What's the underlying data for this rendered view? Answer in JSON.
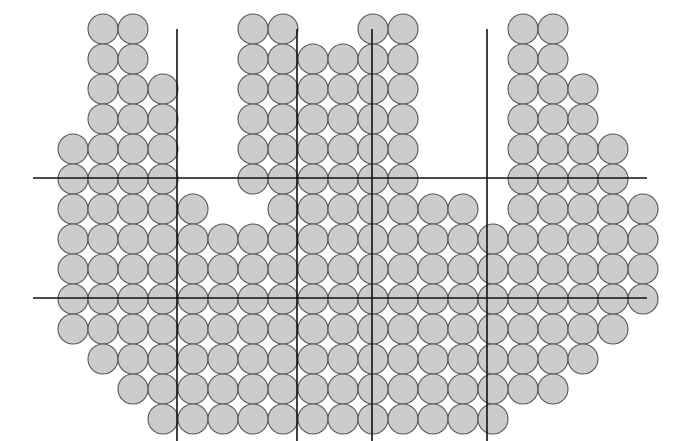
{
  "canvas": {
    "width": 680,
    "height": 441,
    "background": "#ffffff"
  },
  "style": {
    "circle_fill": "#cccccc",
    "circle_stroke": "#555555",
    "circle_stroke_width": 1.1,
    "grid_stroke": "#111111",
    "grid_stroke_width": 1.6
  },
  "geometry": {
    "diameter": 30,
    "radius": 15,
    "col_pitch": 30,
    "row_pitch": 30,
    "origin_x": 73,
    "origin_y": 29,
    "columns": 20,
    "rows": 14
  },
  "grid_lines": {
    "vertical": [
      {
        "name": "v-line-1",
        "x": 177,
        "y1": 29,
        "y2": 441
      },
      {
        "name": "v-line-2",
        "x": 297,
        "y1": 29,
        "y2": 441
      },
      {
        "name": "v-line-3",
        "x": 372,
        "y1": 29,
        "y2": 441
      },
      {
        "name": "v-line-4",
        "x": 487,
        "y1": 29,
        "y2": 441
      }
    ],
    "horizontal": [
      {
        "name": "h-line-1",
        "y": 178,
        "x1": 33,
        "x2": 647
      },
      {
        "name": "h-line-2",
        "y": 298,
        "x1": 33,
        "x2": 647
      }
    ]
  },
  "chart_data": {
    "type": "scatter",
    "title": "",
    "xlabel": "",
    "ylabel": "",
    "marker": "circle",
    "marker_diameter": 30,
    "grid": true,
    "legend": "none",
    "xlim": [
      0,
      20
    ],
    "ylim": [
      0,
      14
    ],
    "column_x": [
      73,
      103,
      133,
      163,
      193,
      223,
      253,
      283,
      313,
      343,
      373,
      403,
      433,
      463,
      493,
      523,
      553,
      583,
      613,
      643
    ],
    "row_y": [
      29,
      59,
      89,
      119,
      149,
      179,
      209,
      239,
      269,
      299,
      329,
      359,
      389,
      419
    ],
    "rows_occupancy": [
      [
        0,
        1,
        1,
        0,
        0,
        0,
        1,
        1,
        0,
        0,
        1,
        1,
        0,
        0,
        0,
        1,
        1,
        0,
        0,
        0
      ],
      [
        0,
        1,
        1,
        0,
        0,
        0,
        1,
        1,
        1,
        1,
        1,
        1,
        0,
        0,
        0,
        1,
        1,
        0,
        0,
        0
      ],
      [
        0,
        1,
        1,
        1,
        0,
        0,
        1,
        1,
        1,
        1,
        1,
        1,
        0,
        0,
        0,
        1,
        1,
        1,
        0,
        0
      ],
      [
        0,
        1,
        1,
        1,
        0,
        0,
        1,
        1,
        1,
        1,
        1,
        1,
        0,
        0,
        0,
        1,
        1,
        1,
        0,
        0
      ],
      [
        1,
        1,
        1,
        1,
        0,
        0,
        1,
        1,
        1,
        1,
        1,
        1,
        0,
        0,
        0,
        1,
        1,
        1,
        1,
        0
      ],
      [
        1,
        1,
        1,
        1,
        0,
        0,
        1,
        1,
        1,
        1,
        1,
        1,
        0,
        0,
        0,
        1,
        1,
        1,
        1,
        0
      ],
      [
        1,
        1,
        1,
        1,
        1,
        0,
        0,
        1,
        1,
        1,
        1,
        1,
        1,
        1,
        0,
        1,
        1,
        1,
        1,
        1
      ],
      [
        1,
        1,
        1,
        1,
        1,
        1,
        1,
        1,
        1,
        1,
        1,
        1,
        1,
        1,
        1,
        1,
        1,
        1,
        1,
        1
      ],
      [
        1,
        1,
        1,
        1,
        1,
        1,
        1,
        1,
        1,
        1,
        1,
        1,
        1,
        1,
        1,
        1,
        1,
        1,
        1,
        1
      ],
      [
        1,
        1,
        1,
        1,
        1,
        1,
        1,
        1,
        1,
        1,
        1,
        1,
        1,
        1,
        1,
        1,
        1,
        1,
        1,
        1
      ],
      [
        1,
        1,
        1,
        1,
        1,
        1,
        1,
        1,
        1,
        1,
        1,
        1,
        1,
        1,
        1,
        1,
        1,
        1,
        1,
        0
      ],
      [
        0,
        1,
        1,
        1,
        1,
        1,
        1,
        1,
        1,
        1,
        1,
        1,
        1,
        1,
        1,
        1,
        1,
        1,
        0,
        0
      ],
      [
        0,
        0,
        1,
        1,
        1,
        1,
        1,
        1,
        1,
        1,
        1,
        1,
        1,
        1,
        1,
        1,
        1,
        0,
        0,
        0
      ],
      [
        0,
        0,
        0,
        1,
        1,
        1,
        1,
        1,
        1,
        1,
        1,
        1,
        1,
        1,
        1,
        0,
        0,
        0,
        0,
        0
      ]
    ],
    "total_circles": 0
  }
}
